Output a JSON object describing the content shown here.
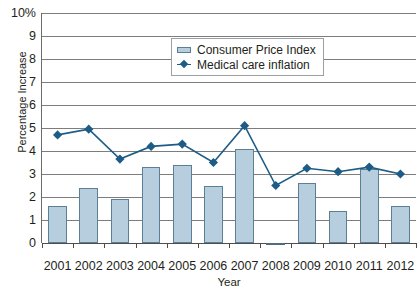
{
  "chart_data": {
    "type": "bar",
    "title": "2001–2012",
    "xlabel": "Year",
    "ylabel": "Percentage Increase",
    "categories": [
      "2001",
      "2002",
      "2003",
      "2004",
      "2005",
      "2006",
      "2007",
      "2008",
      "2009",
      "2010",
      "2011",
      "2012"
    ],
    "ylim": [
      0,
      10
    ],
    "yticks": [
      "0",
      "1",
      "2",
      "3",
      "4",
      "5",
      "6",
      "7",
      "8",
      "9",
      "10%"
    ],
    "ytick_values": [
      0,
      1,
      2,
      3,
      4,
      5,
      6,
      7,
      8,
      9,
      10
    ],
    "grid": true,
    "legend_position": "upper center",
    "series": [
      {
        "name": "Consumer Price Index",
        "type": "bar",
        "color": "#b6cedd",
        "edge_color": "#5b7f94",
        "values": [
          1.6,
          2.4,
          1.9,
          3.3,
          3.4,
          2.5,
          4.1,
          -0.1,
          2.6,
          1.4,
          3.2,
          1.6
        ]
      },
      {
        "name": "Medical care inflation",
        "type": "line",
        "color": "#1d5c86",
        "marker": "diamond",
        "values": [
          4.7,
          4.95,
          3.65,
          4.2,
          4.3,
          3.5,
          5.1,
          2.5,
          3.25,
          3.1,
          3.3,
          3.0
        ]
      }
    ]
  },
  "legend": {
    "items": [
      {
        "label": "Consumer Price Index",
        "icon": "bar-swatch"
      },
      {
        "label": "Medical care inflation",
        "icon": "line-marker-swatch"
      }
    ]
  },
  "axes": {
    "y_title": "Percentage Increase",
    "x_title": "Year"
  },
  "colors": {
    "bar_fill": "#b6cedd",
    "bar_edge": "#5b7f94",
    "line": "#1d5c86",
    "grid": "#7d7d7d",
    "axis": "#4d4d4d",
    "title": "#1b4a66"
  }
}
